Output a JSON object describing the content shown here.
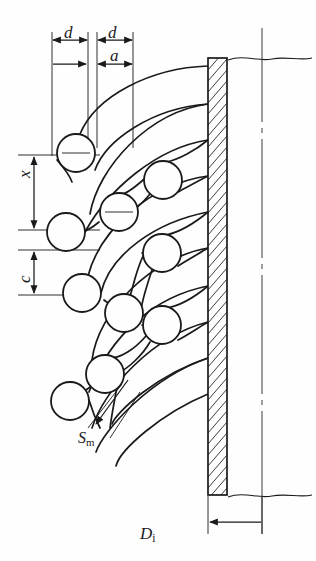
{
  "figure": {
    "kind": "engineering-drawing",
    "line_color": "#1a1a1a",
    "hatch_color": "#1a1a1a",
    "background_color": "#fefefe"
  },
  "labels": {
    "d_first": "d",
    "d_second": "d",
    "a": "a",
    "x": "x",
    "c": "c",
    "s_m": "S",
    "s_m_subscript": "m",
    "d_inner": "D",
    "d_inner_subscript": "i"
  },
  "dimensions": {
    "d_first": {
      "symbol": "d",
      "meaning": "tube outer diameter / pitch increment",
      "orientation": "horizontal",
      "from_x": 52,
      "to_x": 88,
      "line_y": 40,
      "span_px": 36
    },
    "d_second": {
      "symbol": "d",
      "meaning": "tube outer diameter / pitch increment",
      "orientation": "horizontal",
      "from_x": 97,
      "to_x": 133,
      "line_y": 40,
      "span_px": 36
    },
    "a": {
      "symbol": "a",
      "meaning": "clearance between adjacent bend rows",
      "orientation": "horizontal",
      "from_x": 97,
      "to_x": 133,
      "line_y": 64,
      "span_px": 36
    },
    "x": {
      "symbol": "x",
      "meaning": "vertical bend spacing of outer row",
      "orientation": "vertical",
      "from_y": 155,
      "to_y": 230,
      "line_x": 34,
      "span_px": 75
    },
    "c": {
      "symbol": "c",
      "meaning": "vertical bend spacing of inner row",
      "orientation": "vertical",
      "from_y": 250,
      "to_y": 295,
      "line_x": 34,
      "span_px": 45
    },
    "s_m": {
      "symbol": "Sm",
      "meaning": "minimum gap between neighbouring tube bends",
      "orientation": "oblique",
      "leader_from": [
        128,
        376
      ],
      "leader_to": [
        92,
        428
      ]
    },
    "d_inner": {
      "symbol": "Di",
      "meaning": "shell inside diameter measured from tubesheet face to centreline",
      "orientation": "horizontal",
      "from_x": 208,
      "to_x": 262,
      "line_y": 522
    }
  },
  "tubesheet": {
    "name": "tubesheet-wall",
    "left_x": 208,
    "right_x": 227,
    "top_y": 58,
    "bottom_y": 495,
    "hatch_angle_deg": 60,
    "hatch_spacing_px": 11
  },
  "centerline": {
    "name": "shell-centerline",
    "x": 262,
    "top_y": 28,
    "bottom_y": 534,
    "style": "dash-dot"
  },
  "break_lines": [
    {
      "name": "top-break-line",
      "y": 58,
      "from_x": 228,
      "to_x": 312
    },
    {
      "name": "bottom-break-line",
      "y": 495,
      "from_x": 228,
      "to_x": 312
    }
  ],
  "tube_ends": [
    {
      "id": 1,
      "cx": 76,
      "cy": 153,
      "r": 19,
      "row": "outer"
    },
    {
      "id": 2,
      "cx": 163,
      "cy": 180,
      "r": 19,
      "row": "inner"
    },
    {
      "id": 3,
      "cx": 119,
      "cy": 212,
      "r": 19,
      "row": "outer"
    },
    {
      "id": 4,
      "cx": 66,
      "cy": 232,
      "r": 19,
      "row": "outer"
    },
    {
      "id": 5,
      "cx": 162,
      "cy": 253,
      "r": 19,
      "row": "inner"
    },
    {
      "id": 6,
      "cx": 82,
      "cy": 293,
      "r": 19,
      "row": "outer"
    },
    {
      "id": 7,
      "cx": 124,
      "cy": 313,
      "r": 19,
      "row": "outer"
    },
    {
      "id": 8,
      "cx": 162,
      "cy": 325,
      "r": 19,
      "row": "inner"
    },
    {
      "id": 9,
      "cx": 105,
      "cy": 374,
      "r": 19,
      "row": "outer"
    },
    {
      "id": 10,
      "cx": 70,
      "cy": 401,
      "r": 19,
      "row": "outer"
    }
  ],
  "extension_lines": {
    "vertical": [
      {
        "x": 52,
        "top_y": 32,
        "bottom_y": 155
      },
      {
        "x": 88,
        "top_y": 32,
        "bottom_y": 150
      },
      {
        "x": 97,
        "top_y": 32,
        "bottom_y": 150
      },
      {
        "x": 133,
        "top_y": 32,
        "bottom_y": 150
      }
    ],
    "horizontal": [
      {
        "y": 155,
        "from_x": 18,
        "to_x": 100
      },
      {
        "y": 230,
        "from_x": 18,
        "to_x": 100
      },
      {
        "y": 250,
        "from_x": 18,
        "to_x": 100
      },
      {
        "y": 295,
        "from_x": 18,
        "to_x": 100
      }
    ]
  }
}
